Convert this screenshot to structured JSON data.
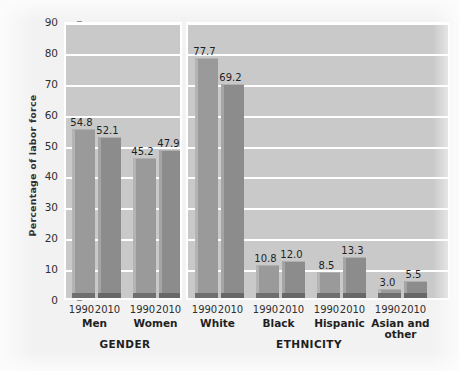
{
  "chart_data": {
    "type": "bar",
    "title": "",
    "xlabel": "",
    "ylabel": "Percentage of labor force",
    "ylim": [
      0,
      90
    ],
    "ytick_step": 10,
    "yticks": [
      "0",
      "10",
      "20",
      "30",
      "40",
      "50",
      "60",
      "70",
      "80",
      "90"
    ],
    "grid": true,
    "legend": "none",
    "sections": [
      {
        "name": "GENDER",
        "groups": [
          {
            "label": "Men",
            "bars": [
              {
                "year": "1990",
                "value": 54.8,
                "label": "54.8"
              },
              {
                "year": "2010",
                "value": 52.1,
                "label": "52.1"
              }
            ]
          },
          {
            "label": "Women",
            "bars": [
              {
                "year": "1990",
                "value": 45.2,
                "label": "45.2"
              },
              {
                "year": "2010",
                "value": 47.9,
                "label": "47.9"
              }
            ]
          }
        ]
      },
      {
        "name": "ETHNICITY",
        "groups": [
          {
            "label": "White",
            "bars": [
              {
                "year": "1990",
                "value": 77.7,
                "label": "77.7"
              },
              {
                "year": "2010",
                "value": 69.2,
                "label": "69.2"
              }
            ]
          },
          {
            "label": "Black",
            "bars": [
              {
                "year": "1990",
                "value": 10.8,
                "label": "10.8"
              },
              {
                "year": "2010",
                "value": 12.0,
                "label": "12.0"
              }
            ]
          },
          {
            "label": "Hispanic",
            "bars": [
              {
                "year": "1990",
                "value": 8.5,
                "label": "8.5"
              },
              {
                "year": "2010",
                "value": 13.3,
                "label": "13.3"
              }
            ]
          },
          {
            "label": "Asian and other",
            "label_lines": [
              "Asian and",
              "other"
            ],
            "bars": [
              {
                "year": "1990",
                "value": 3.0,
                "label": "3.0"
              },
              {
                "year": "2010",
                "value": 5.5,
                "label": "5.5"
              }
            ]
          }
        ]
      }
    ],
    "colors": {
      "plot_background": "#c9c9c9",
      "gridline": "#ffffff",
      "bar_1990": "#9a9a9a",
      "bar_2010": "#8c8c8c",
      "bar_base_shadow": "#6f6f6f",
      "text": "#1f1f1f",
      "page_background": "#f2f2f2"
    }
  }
}
